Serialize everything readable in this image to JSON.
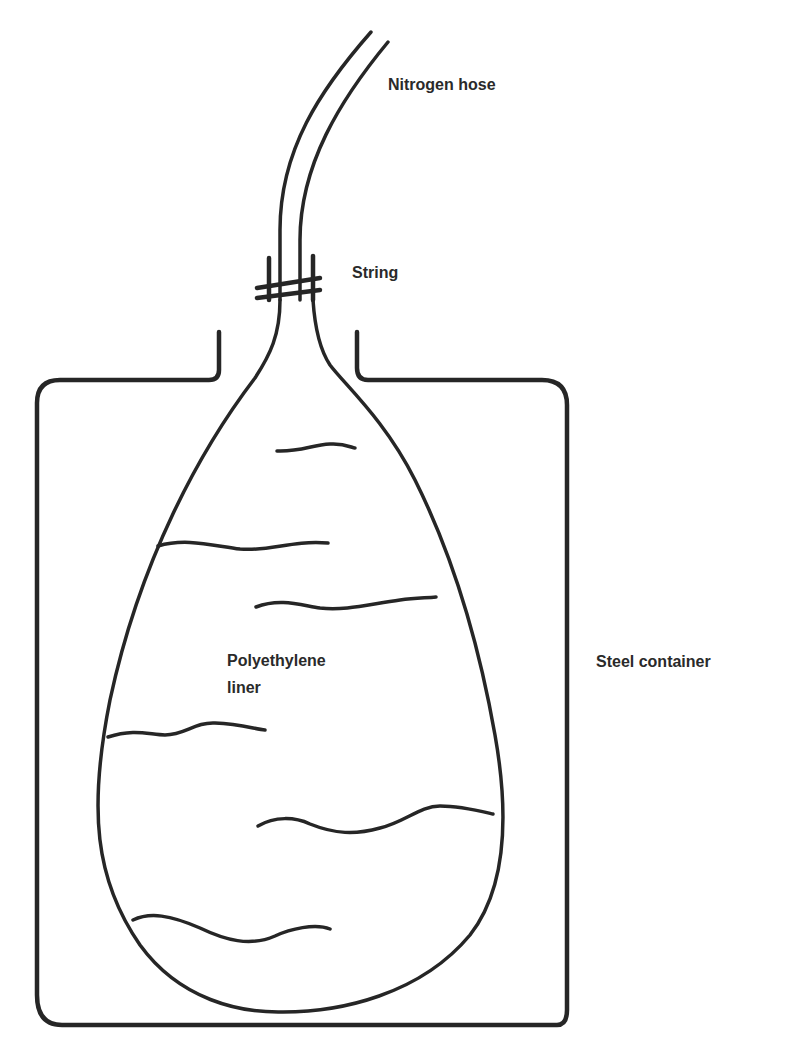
{
  "diagram": {
    "stroke_color": "#262626",
    "background": "#ffffff",
    "labels": {
      "nitrogen_hose": "Nitrogen hose",
      "string": "String",
      "polyethylene_liner_line1": "Polyethylene",
      "polyethylene_liner_line2": "liner",
      "steel_container": "Steel container"
    },
    "components": [
      {
        "id": "nitrogen-hose",
        "label": "Nitrogen hose"
      },
      {
        "id": "string",
        "label": "String"
      },
      {
        "id": "polyethylene-liner",
        "label": "Polyethylene liner"
      },
      {
        "id": "steel-container",
        "label": "Steel container"
      }
    ]
  }
}
